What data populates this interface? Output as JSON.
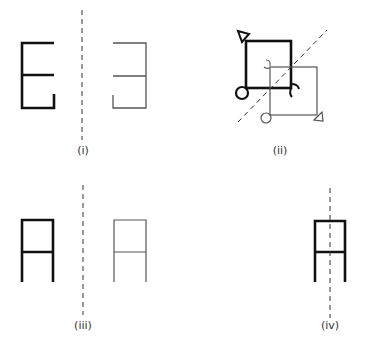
{
  "figures": [
    {
      "id": "i",
      "label": "(i)",
      "description": "Letter E shape reflected across vertical dashed mirror line"
    },
    {
      "id": "ii",
      "label": "(ii)",
      "description": "Square with circle and triangle markers reflected across diagonal dashed mirror line"
    },
    {
      "id": "iii",
      "label": "(iii)",
      "description": "Symmetric A-like shape reflected across vertical dashed mirror line"
    },
    {
      "id": "iv",
      "label": "(iv)",
      "description": "A-like shape with vertical dashed line of symmetry through its centre"
    }
  ],
  "colors": {
    "bold_stroke": "#111111",
    "thin_stroke": "#555555",
    "mirror_line": "#333333"
  }
}
